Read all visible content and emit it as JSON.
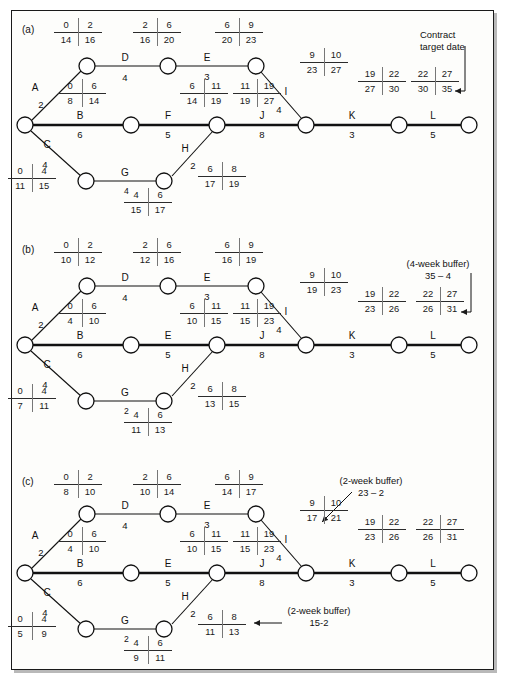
{
  "figure": {
    "type": "activity-on-arrow network diagram",
    "panels": [
      "(a)",
      "(b)",
      "(c)"
    ]
  },
  "activities": [
    {
      "id": "A",
      "duration": "2"
    },
    {
      "id": "B",
      "duration": "6"
    },
    {
      "id": "C",
      "duration": "4"
    },
    {
      "id": "D",
      "duration": "4"
    },
    {
      "id": "E",
      "duration": "3"
    },
    {
      "id": "F",
      "duration": "5"
    },
    {
      "id": "G",
      "duration": "4"
    },
    {
      "id": "H",
      "duration": "2"
    },
    {
      "id": "I",
      "duration": "4"
    },
    {
      "id": "J",
      "duration": "8"
    },
    {
      "id": "K",
      "duration": "3"
    },
    {
      "id": "L",
      "duration": "5"
    }
  ],
  "panel_a": {
    "label": "(a)",
    "edges": [
      {
        "name": "A",
        "duration": "2"
      },
      {
        "name": "D",
        "duration": "4"
      },
      {
        "name": "E",
        "duration": "3"
      },
      {
        "name": "B",
        "duration": "6"
      },
      {
        "name": "F",
        "duration": "5"
      },
      {
        "name": "C",
        "duration": "4"
      },
      {
        "name": "G",
        "duration": "4"
      },
      {
        "name": "H",
        "duration": "2"
      },
      {
        "name": "I",
        "duration": "4"
      },
      {
        "name": "J",
        "duration": "8"
      },
      {
        "name": "K",
        "duration": "3"
      },
      {
        "name": "L",
        "duration": "5"
      }
    ],
    "boxes": {
      "D": {
        "es": "0",
        "ef": "2",
        "ls": "14",
        "lf": "16"
      },
      "E": {
        "es": "2",
        "ef": "6",
        "ls": "16",
        "lf": "20"
      },
      "I": {
        "es": "6",
        "ef": "9",
        "ls": "20",
        "lf": "23"
      },
      "B": {
        "es": "0",
        "ef": "6",
        "ls": "8",
        "lf": "14"
      },
      "F": {
        "es": "6",
        "ef": "11",
        "ls": "14",
        "lf": "19"
      },
      "J": {
        "es": "11",
        "ef": "19",
        "ls": "19",
        "lf": "27"
      },
      "Iarm": {
        "es": "9",
        "ef": "10",
        "ls": "23",
        "lf": "27"
      },
      "K": {
        "es": "19",
        "ef": "22",
        "ls": "27",
        "lf": "30"
      },
      "L": {
        "es": "22",
        "ef": "27",
        "ls": "30",
        "lf": "35"
      },
      "C": {
        "es": "0",
        "ef": "4",
        "ls": "11",
        "lf": "15"
      },
      "G": {
        "es": "4",
        "ef": "6",
        "ls": "15",
        "lf": "17"
      },
      "H": {
        "es": "6",
        "ef": "8",
        "ls": "17",
        "lf": "19"
      }
    },
    "annotation": {
      "line1": "Contract",
      "line2": "target date"
    },
    "g_prefix": "4"
  },
  "panel_b": {
    "label": "(b)",
    "edges": [
      {
        "name": "A",
        "duration": "2"
      },
      {
        "name": "D",
        "duration": "4"
      },
      {
        "name": "E",
        "duration": "3"
      },
      {
        "name": "B",
        "duration": "6"
      },
      {
        "name": "E",
        "duration": "5"
      },
      {
        "name": "C",
        "duration": "4"
      },
      {
        "name": "G",
        "duration": "4"
      },
      {
        "name": "H",
        "duration": "2"
      },
      {
        "name": "I",
        "duration": "4"
      },
      {
        "name": "J",
        "duration": "8"
      },
      {
        "name": "K",
        "duration": "3"
      },
      {
        "name": "L",
        "duration": "5"
      }
    ],
    "boxes": {
      "D": {
        "es": "0",
        "ef": "2",
        "ls": "10",
        "lf": "12"
      },
      "E": {
        "es": "2",
        "ef": "6",
        "ls": "12",
        "lf": "16"
      },
      "I": {
        "es": "6",
        "ef": "9",
        "ls": "16",
        "lf": "19"
      },
      "B": {
        "es": "0",
        "ef": "6",
        "ls": "4",
        "lf": "10"
      },
      "F": {
        "es": "6",
        "ef": "11",
        "ls": "10",
        "lf": "15"
      },
      "J": {
        "es": "11",
        "ef": "19",
        "ls": "15",
        "lf": "23"
      },
      "Iarm": {
        "es": "9",
        "ef": "10",
        "ls": "19",
        "lf": "23"
      },
      "K": {
        "es": "19",
        "ef": "22",
        "ls": "23",
        "lf": "26"
      },
      "L": {
        "es": "22",
        "ef": "27",
        "ls": "26",
        "lf": "31"
      },
      "C": {
        "es": "0",
        "ef": "4",
        "ls": "7",
        "lf": "11"
      },
      "G": {
        "es": "4",
        "ef": "6",
        "ls": "11",
        "lf": "13"
      },
      "H": {
        "es": "6",
        "ef": "8",
        "ls": "13",
        "lf": "15"
      }
    },
    "annotation": {
      "line1": "(4-week buffer)",
      "line2": "35 – 4"
    },
    "g_prefix": "2"
  },
  "panel_c": {
    "label": "(c)",
    "edges": [
      {
        "name": "A",
        "duration": "2"
      },
      {
        "name": "D",
        "duration": "4"
      },
      {
        "name": "E",
        "duration": "3"
      },
      {
        "name": "B",
        "duration": "6"
      },
      {
        "name": "E",
        "duration": "5"
      },
      {
        "name": "C",
        "duration": "4"
      },
      {
        "name": "G",
        "duration": "4"
      },
      {
        "name": "H",
        "duration": "2"
      },
      {
        "name": "I",
        "duration": "4"
      },
      {
        "name": "J",
        "duration": "8"
      },
      {
        "name": "K",
        "duration": "3"
      },
      {
        "name": "L",
        "duration": "5"
      }
    ],
    "boxes": {
      "D": {
        "es": "0",
        "ef": "2",
        "ls": "8",
        "lf": "10"
      },
      "E": {
        "es": "2",
        "ef": "6",
        "ls": "10",
        "lf": "14"
      },
      "I": {
        "es": "6",
        "ef": "9",
        "ls": "14",
        "lf": "17"
      },
      "B": {
        "es": "0",
        "ef": "6",
        "ls": "4",
        "lf": "10"
      },
      "F": {
        "es": "6",
        "ef": "11",
        "ls": "10",
        "lf": "15"
      },
      "J": {
        "es": "11",
        "ef": "19",
        "ls": "15",
        "lf": "23"
      },
      "Iarm": {
        "es": "9",
        "ef": "10",
        "ls": "17",
        "lf": "21"
      },
      "K": {
        "es": "19",
        "ef": "22",
        "ls": "23",
        "lf": "26"
      },
      "L": {
        "es": "22",
        "ef": "27",
        "ls": "26",
        "lf": "31"
      },
      "C": {
        "es": "0",
        "ef": "4",
        "ls": "5",
        "lf": "9"
      },
      "G": {
        "es": "4",
        "ef": "6",
        "ls": "9",
        "lf": "11"
      },
      "H": {
        "es": "6",
        "ef": "8",
        "ls": "11",
        "lf": "13"
      }
    },
    "annotation_top": {
      "line1": "(2-week buffer)",
      "line2": "23 – 2"
    },
    "annotation_bottom": {
      "line1": "(2-week buffer)",
      "line2": "15-2"
    },
    "g_prefix": "2"
  }
}
